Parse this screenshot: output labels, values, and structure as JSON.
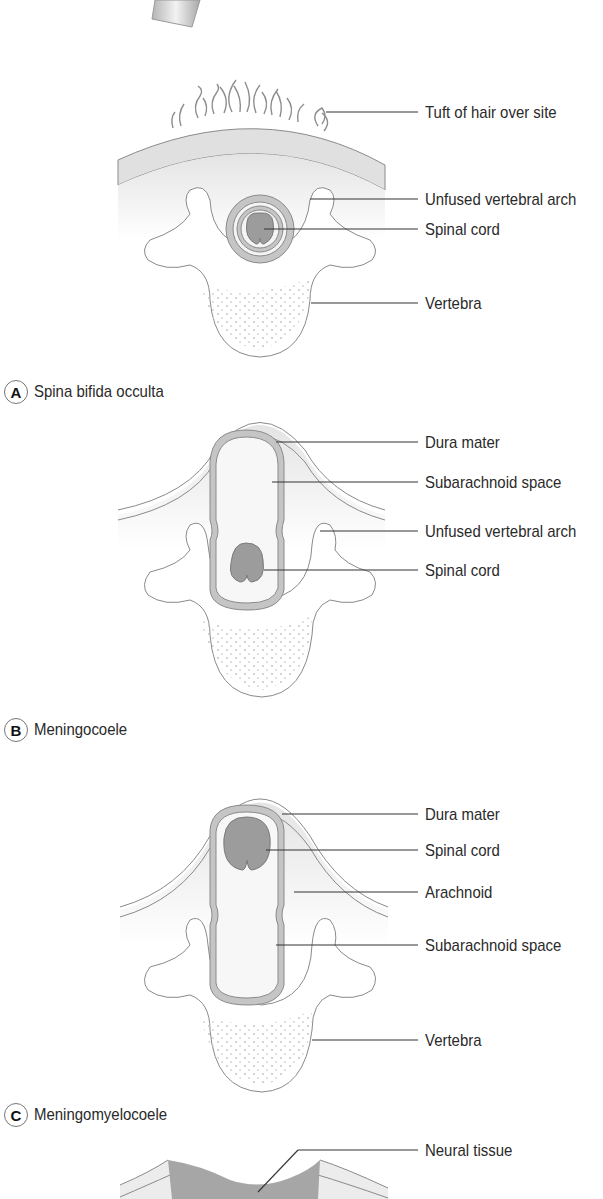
{
  "figure": {
    "panels": [
      {
        "id": "A",
        "caption": "Spina bifida occulta",
        "labels": [
          "Tuft of hair over site",
          "Unfused vertebral arch",
          "Spinal cord",
          "Vertebra"
        ]
      },
      {
        "id": "B",
        "caption": "Meningocoele",
        "labels": [
          "Dura mater",
          "Subarachnoid space",
          "Unfused vertebral arch",
          "Spinal cord"
        ]
      },
      {
        "id": "C",
        "caption": "Meningomyelocoele",
        "labels": [
          "Dura mater",
          "Spinal cord",
          "Arachnoid",
          "Subarachnoid space",
          "Vertebra"
        ]
      },
      {
        "id": "D",
        "labels": [
          "Neural tissue"
        ]
      }
    ],
    "colors": {
      "outline": "#8a8a8a",
      "cord_fill": "#9c9c9c",
      "meninges_fill": "#c8c8c8",
      "skin_fill": "#e6e6e6",
      "leader_line": "#333333"
    }
  }
}
